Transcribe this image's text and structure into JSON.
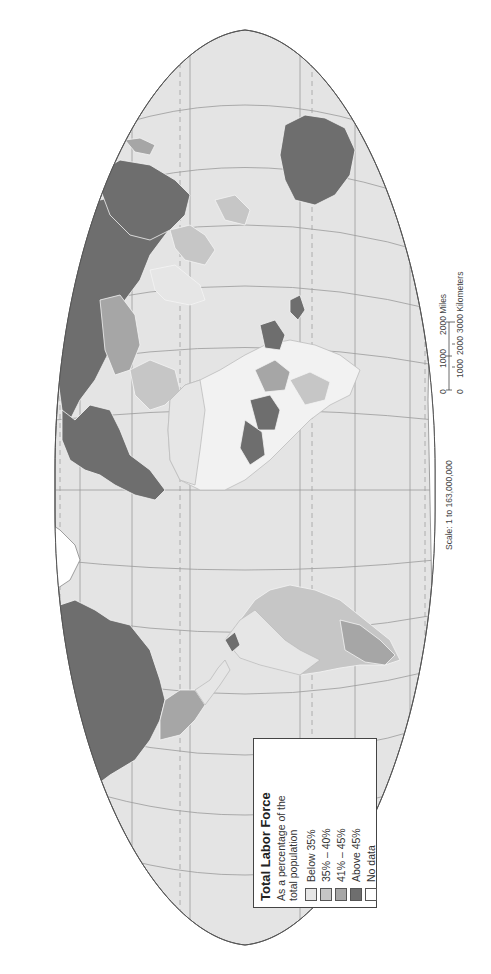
{
  "map": {
    "orientation": "rotated 90 degrees (north to the left)",
    "projection_outline": "oval world map with graticule",
    "colors": {
      "water": "#e4e4e4",
      "graticule": "#9a9a9a",
      "tropic_lines": "#a8a8a8",
      "below_35": "#e6e6e6",
      "35_40": "#c6c6c6",
      "41_45": "#a6a6a6",
      "above_45": "#6e6e6e",
      "no_data": "#ffffff",
      "border": "#f4f4f4",
      "outline": "#555555"
    }
  },
  "legend": {
    "title": "Total Labor Force",
    "subtitle_line1": "As a percentage of the",
    "subtitle_line2": "total population",
    "items": [
      {
        "label": "Below 35%",
        "color": "#e6e6e6"
      },
      {
        "label": "35% – 40%",
        "color": "#c6c6c6"
      },
      {
        "label": "41% – 45%",
        "color": "#a6a6a6"
      },
      {
        "label": "Above 45%",
        "color": "#6e6e6e"
      },
      {
        "label": "No data",
        "color": "#ffffff"
      }
    ]
  },
  "scale": {
    "ratio_label": "Scale: 1 to 163,000,000",
    "miles_ticks": [
      "0",
      "1000",
      "2000 Miles"
    ],
    "km_ticks": [
      "0",
      "1000",
      "2000",
      "3000 Kilometers"
    ]
  }
}
